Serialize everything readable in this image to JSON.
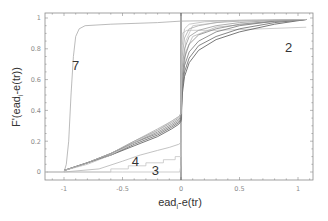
{
  "chart_data": {
    "type": "line",
    "title": "",
    "xlabel": "ead_i-e(tr)",
    "xlabel_main": "ead",
    "xlabel_sub": "i",
    "xlabel_rest": "-e(tr)",
    "ylabel": "F'(ead_i-e(tr))",
    "ylabel_main": "F'(ead",
    "ylabel_sub": "i",
    "ylabel_rest": "-e(tr))",
    "xlim": [
      -1.15,
      1.15
    ],
    "ylim": [
      -0.05,
      1.03
    ],
    "x_ticks": [
      -1,
      -0.5,
      0,
      0.5,
      1
    ],
    "x_tick_labels": [
      "-1",
      "-0.5",
      "0",
      "0.5",
      "1"
    ],
    "y_ticks": [
      0,
      0.2,
      0.4,
      0.6,
      0.8,
      1
    ],
    "y_tick_labels": [
      "0",
      "0.2",
      "0.4",
      "0.6",
      "0.8",
      "1"
    ],
    "grid": false,
    "legend": "none",
    "vertical_reference_line": 0,
    "annotations": [
      {
        "text": "7",
        "x": -0.9,
        "y": 0.66
      },
      {
        "text": "2",
        "x": 0.92,
        "y": 0.78
      },
      {
        "text": "4",
        "x": -0.39,
        "y": 0.04
      },
      {
        "text": "3",
        "x": -0.22,
        "y": -0.02
      }
    ],
    "series": [
      {
        "name": "7",
        "color": "#a9a9a9",
        "points": [
          [
            -1.15,
            0
          ],
          [
            -1.0,
            0
          ],
          [
            -0.98,
            0.05
          ],
          [
            -0.96,
            0.2
          ],
          [
            -0.94,
            0.5
          ],
          [
            -0.92,
            0.75
          ],
          [
            -0.9,
            0.88
          ],
          [
            -0.87,
            0.93
          ],
          [
            -0.82,
            0.95
          ],
          [
            -0.6,
            0.96
          ],
          [
            -0.2,
            0.97
          ],
          [
            0,
            0.98
          ],
          [
            0.5,
            0.985
          ],
          [
            1.07,
            0.99
          ]
        ]
      },
      {
        "name": "2",
        "color": "#c0c0c0",
        "points": [
          [
            -1.15,
            0
          ],
          [
            -1.0,
            0
          ],
          [
            -0.5,
            0
          ],
          [
            -0.01,
            0
          ],
          [
            0.0,
            0.05
          ],
          [
            0.005,
            0.8
          ],
          [
            0.01,
            0.9
          ],
          [
            0.05,
            0.92
          ],
          [
            0.3,
            0.92
          ],
          [
            0.7,
            0.93
          ],
          [
            1.07,
            0.94
          ]
        ]
      },
      {
        "name": "3",
        "color": "#c4c4c4",
        "points": [
          [
            -1.0,
            0
          ],
          [
            -0.6,
            0
          ],
          [
            -0.6,
            0.02
          ],
          [
            -0.45,
            0.02
          ],
          [
            -0.45,
            0.04
          ],
          [
            -0.3,
            0.04
          ],
          [
            -0.3,
            0.06
          ],
          [
            -0.15,
            0.06
          ],
          [
            -0.15,
            0.08
          ],
          [
            -0.05,
            0.08
          ],
          [
            -0.05,
            0.1
          ],
          [
            0,
            0.1
          ],
          [
            0.01,
            0.6
          ],
          [
            0.04,
            0.85
          ],
          [
            0.1,
            0.95
          ],
          [
            0.4,
            0.98
          ],
          [
            1.07,
            0.99
          ]
        ]
      },
      {
        "name": "4",
        "color": "#b4b4b4",
        "points": [
          [
            -1.0,
            0
          ],
          [
            -0.7,
            0.02
          ],
          [
            -0.5,
            0.07
          ],
          [
            -0.35,
            0.11
          ],
          [
            -0.2,
            0.14
          ],
          [
            -0.1,
            0.16
          ],
          [
            -0.02,
            0.18
          ],
          [
            0,
            0.19
          ],
          [
            0.01,
            0.55
          ],
          [
            0.04,
            0.78
          ],
          [
            0.1,
            0.88
          ],
          [
            0.3,
            0.94
          ],
          [
            0.7,
            0.97
          ],
          [
            1.07,
            0.99
          ]
        ]
      },
      {
        "name": "a",
        "color": "#555555",
        "points": [
          [
            -1.0,
            0.01
          ],
          [
            -0.8,
            0.06
          ],
          [
            -0.6,
            0.11
          ],
          [
            -0.4,
            0.17
          ],
          [
            -0.2,
            0.23
          ],
          [
            -0.08,
            0.28
          ],
          [
            -0.02,
            0.31
          ],
          [
            0,
            0.33
          ],
          [
            0.01,
            0.5
          ],
          [
            0.03,
            0.62
          ],
          [
            0.07,
            0.71
          ],
          [
            0.15,
            0.79
          ],
          [
            0.3,
            0.86
          ],
          [
            0.5,
            0.91
          ],
          [
            0.8,
            0.96
          ],
          [
            1.07,
            0.99
          ]
        ]
      },
      {
        "name": "b",
        "color": "#666666",
        "points": [
          [
            -1.0,
            0.01
          ],
          [
            -0.8,
            0.06
          ],
          [
            -0.6,
            0.11
          ],
          [
            -0.4,
            0.18
          ],
          [
            -0.2,
            0.24
          ],
          [
            -0.08,
            0.29
          ],
          [
            -0.02,
            0.32
          ],
          [
            0,
            0.34
          ],
          [
            0.01,
            0.53
          ],
          [
            0.03,
            0.65
          ],
          [
            0.07,
            0.74
          ],
          [
            0.15,
            0.82
          ],
          [
            0.3,
            0.88
          ],
          [
            0.5,
            0.93
          ],
          [
            0.8,
            0.97
          ],
          [
            1.07,
            0.99
          ]
        ]
      },
      {
        "name": "c",
        "color": "#777777",
        "points": [
          [
            -1.0,
            0.01
          ],
          [
            -0.8,
            0.06
          ],
          [
            -0.6,
            0.12
          ],
          [
            -0.4,
            0.19
          ],
          [
            -0.2,
            0.25
          ],
          [
            -0.08,
            0.3
          ],
          [
            -0.02,
            0.33
          ],
          [
            0,
            0.35
          ],
          [
            0.01,
            0.57
          ],
          [
            0.03,
            0.69
          ],
          [
            0.07,
            0.78
          ],
          [
            0.15,
            0.85
          ],
          [
            0.3,
            0.91
          ],
          [
            0.5,
            0.95
          ],
          [
            0.8,
            0.98
          ],
          [
            1.07,
            0.99
          ]
        ]
      },
      {
        "name": "d",
        "color": "#888888",
        "points": [
          [
            -1.0,
            0.01
          ],
          [
            -0.8,
            0.06
          ],
          [
            -0.6,
            0.12
          ],
          [
            -0.4,
            0.19
          ],
          [
            -0.2,
            0.26
          ],
          [
            -0.08,
            0.31
          ],
          [
            -0.02,
            0.34
          ],
          [
            0,
            0.36
          ],
          [
            0.01,
            0.62
          ],
          [
            0.03,
            0.74
          ],
          [
            0.07,
            0.83
          ],
          [
            0.15,
            0.89
          ],
          [
            0.3,
            0.93
          ],
          [
            0.5,
            0.96
          ],
          [
            0.8,
            0.98
          ],
          [
            1.07,
            0.99
          ]
        ]
      },
      {
        "name": "e",
        "color": "#999999",
        "points": [
          [
            -1.0,
            0.01
          ],
          [
            -0.8,
            0.06
          ],
          [
            -0.6,
            0.12
          ],
          [
            -0.4,
            0.2
          ],
          [
            -0.2,
            0.27
          ],
          [
            -0.08,
            0.32
          ],
          [
            -0.02,
            0.35
          ],
          [
            0,
            0.37
          ],
          [
            0.01,
            0.68
          ],
          [
            0.03,
            0.8
          ],
          [
            0.07,
            0.88
          ],
          [
            0.15,
            0.92
          ],
          [
            0.3,
            0.95
          ],
          [
            0.5,
            0.97
          ],
          [
            0.8,
            0.985
          ],
          [
            1.07,
            0.99
          ]
        ]
      },
      {
        "name": "f",
        "color": "#aaaaaa",
        "points": [
          [
            -1.0,
            0.01
          ],
          [
            -0.8,
            0.06
          ],
          [
            -0.6,
            0.12
          ],
          [
            -0.4,
            0.2
          ],
          [
            -0.2,
            0.28
          ],
          [
            -0.08,
            0.33
          ],
          [
            -0.02,
            0.36
          ],
          [
            0,
            0.38
          ],
          [
            0.01,
            0.75
          ],
          [
            0.03,
            0.87
          ],
          [
            0.07,
            0.93
          ],
          [
            0.15,
            0.95
          ],
          [
            0.3,
            0.97
          ],
          [
            0.5,
            0.98
          ],
          [
            1.07,
            0.99
          ]
        ]
      },
      {
        "name": "g",
        "color": "#bbbbbb",
        "points": [
          [
            -1.0,
            0.01
          ],
          [
            -0.8,
            0.05
          ],
          [
            -0.6,
            0.11
          ],
          [
            -0.4,
            0.19
          ],
          [
            -0.2,
            0.27
          ],
          [
            -0.08,
            0.33
          ],
          [
            -0.02,
            0.36
          ],
          [
            0,
            0.38
          ],
          [
            0.01,
            0.82
          ],
          [
            0.03,
            0.93
          ],
          [
            0.07,
            0.96
          ],
          [
            0.2,
            0.975
          ],
          [
            0.5,
            0.985
          ],
          [
            1.07,
            0.99
          ]
        ]
      }
    ]
  },
  "colors": {
    "frame": "#8a8a8a",
    "zero_line": "#555555",
    "background": "#ffffff"
  }
}
